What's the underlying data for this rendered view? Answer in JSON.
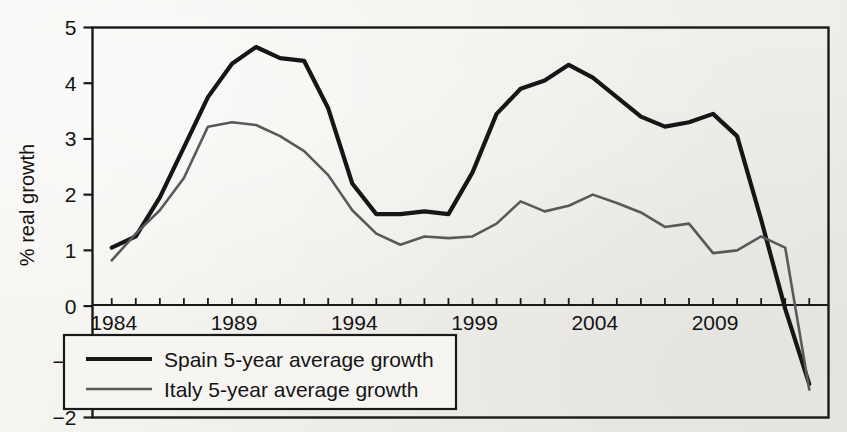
{
  "figure": {
    "background_color": "#f3f2ee",
    "frame_color": "#1a1a1a"
  },
  "chart_data": {
    "type": "line",
    "title": "",
    "subtitle": "",
    "xlabel": "",
    "ylabel": "% real growth",
    "xlim": [
      1983.2,
      1913.0
    ],
    "x_axis_start": 1983.2,
    "x_axis_end": 2013.8,
    "ylim": [
      -2,
      5
    ],
    "ytick_labels": [
      "5",
      "4",
      "3",
      "2",
      "1",
      "0",
      "−1",
      "−2"
    ],
    "yticks": [
      5,
      4,
      3,
      2,
      1,
      0,
      -1,
      -2
    ],
    "xtick_labels": [
      "1984",
      "1989",
      "1994",
      "1999",
      "2004",
      "2009"
    ],
    "xticks_labeled": [
      1984,
      1989,
      1994,
      1999,
      2004,
      2009
    ],
    "xticks_minor_step": 1,
    "grid": false,
    "legend_position": "lower left",
    "zero_line": true,
    "x": [
      1984,
      1985,
      1986,
      1987,
      1988,
      1989,
      1990,
      1991,
      1992,
      1993,
      1994,
      1995,
      1996,
      1997,
      1998,
      1999,
      2000,
      2001,
      2002,
      2003,
      2004,
      2005,
      2006,
      2007,
      2008,
      2009,
      2010,
      2011,
      2012,
      2013
    ],
    "series": [
      {
        "name": "Spain 5-year average growth",
        "color": "#161616",
        "width": 4.2,
        "values": [
          1.05,
          1.25,
          1.95,
          2.85,
          3.75,
          4.35,
          4.65,
          4.45,
          4.4,
          3.55,
          2.2,
          1.65,
          1.65,
          1.7,
          1.65,
          2.4,
          3.45,
          3.9,
          4.05,
          4.33,
          4.1,
          3.75,
          3.4,
          3.22,
          3.3,
          3.45,
          3.05,
          1.55,
          -0.05,
          -1.4
        ]
      },
      {
        "name": "Italy 5-year average growth",
        "color": "#595959",
        "width": 2.6,
        "values": [
          0.82,
          1.3,
          1.72,
          2.3,
          3.22,
          3.3,
          3.25,
          3.05,
          2.78,
          2.35,
          1.72,
          1.3,
          1.1,
          1.25,
          1.22,
          1.25,
          1.48,
          1.88,
          1.7,
          1.8,
          2.0,
          1.85,
          1.68,
          1.42,
          1.48,
          0.95,
          1.0,
          1.25,
          1.05,
          -1.5
        ]
      }
    ],
    "legend_entries": [
      {
        "label": "Spain 5-year average growth",
        "color": "#161616",
        "width": 4.2
      },
      {
        "label": "Italy 5-year average growth",
        "color": "#595959",
        "width": 2.6
      }
    ]
  }
}
